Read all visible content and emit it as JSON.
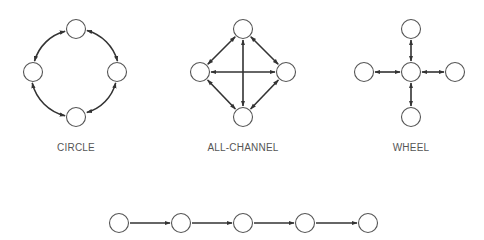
{
  "diagram": {
    "colors": {
      "node_stroke": "#555555",
      "edge": "#333333",
      "label": "#555555",
      "background": "#ffffff"
    },
    "networks": [
      {
        "id": "circle",
        "label": "CIRCLE",
        "label_pos": [
          76,
          151
        ],
        "nodes": [
          [
            76,
            29
          ],
          [
            33,
            72
          ],
          [
            117,
            72
          ],
          [
            76,
            117
          ]
        ],
        "edges": [
          {
            "type": "arc",
            "from": 0,
            "to": 2,
            "both": true
          },
          {
            "type": "arc",
            "from": 2,
            "to": 3,
            "both": true
          },
          {
            "type": "arc",
            "from": 3,
            "to": 1,
            "both": true
          },
          {
            "type": "arc",
            "from": 1,
            "to": 0,
            "both": true
          }
        ]
      },
      {
        "id": "all-channel",
        "label": "ALL-CHANNEL",
        "label_pos": [
          243,
          151
        ],
        "nodes": [
          [
            243,
            29
          ],
          [
            200,
            72
          ],
          [
            286,
            72
          ],
          [
            243,
            117
          ]
        ],
        "edges": [
          {
            "type": "line",
            "from": 0,
            "to": 1,
            "both": true
          },
          {
            "type": "line",
            "from": 0,
            "to": 2,
            "both": true
          },
          {
            "type": "line",
            "from": 1,
            "to": 3,
            "both": true
          },
          {
            "type": "line",
            "from": 2,
            "to": 3,
            "both": true
          },
          {
            "type": "line",
            "from": 0,
            "to": 3,
            "both": true
          },
          {
            "type": "line",
            "from": 1,
            "to": 2,
            "both": true
          }
        ]
      },
      {
        "id": "wheel",
        "label": "WHEEL",
        "label_pos": [
          411,
          151
        ],
        "nodes": [
          [
            411,
            72
          ],
          [
            411,
            29
          ],
          [
            364,
            72
          ],
          [
            455,
            72
          ],
          [
            411,
            117
          ]
        ],
        "edges": [
          {
            "type": "line",
            "from": 0,
            "to": 1,
            "both": true
          },
          {
            "type": "line",
            "from": 0,
            "to": 2,
            "both": true
          },
          {
            "type": "line",
            "from": 0,
            "to": 3,
            "both": true
          },
          {
            "type": "line",
            "from": 0,
            "to": 4,
            "both": true
          }
        ]
      },
      {
        "id": "chain",
        "label": "",
        "label_pos": [
          243,
          240
        ],
        "nodes": [
          [
            119,
            223
          ],
          [
            181,
            223
          ],
          [
            243,
            223
          ],
          [
            305,
            223
          ],
          [
            368,
            223
          ]
        ],
        "edges": [
          {
            "type": "line",
            "from": 0,
            "to": 1,
            "both": false
          },
          {
            "type": "line",
            "from": 1,
            "to": 2,
            "both": false
          },
          {
            "type": "line",
            "from": 2,
            "to": 3,
            "both": false
          },
          {
            "type": "line",
            "from": 3,
            "to": 4,
            "both": false
          }
        ]
      }
    ],
    "node_radius": 9.5
  }
}
